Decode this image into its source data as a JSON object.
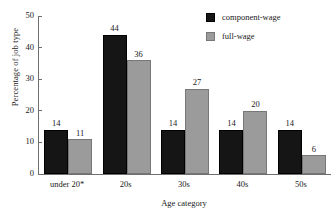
{
  "chart_data": {
    "type": "bar",
    "title": "",
    "xlabel": "Age category",
    "ylabel": "Percentage of job type",
    "categories": [
      "under 20*",
      "20s",
      "30s",
      "40s",
      "50s"
    ],
    "series": [
      {
        "name": "component-wage",
        "color": "#151515",
        "values": [
          14,
          44,
          14,
          14,
          14
        ]
      },
      {
        "name": "full-wage",
        "color": "#9b9b9b",
        "values": [
          11,
          36,
          27,
          20,
          6
        ]
      }
    ],
    "ylim": [
      0,
      50
    ],
    "yticks": [
      0,
      10,
      20,
      30,
      40,
      50
    ],
    "ytick_labels": [
      "0",
      "10",
      "20",
      "30",
      "40",
      "50"
    ],
    "grid": false,
    "legend_position": "top-right",
    "data_labels": true
  },
  "axes": {
    "y_title": "Percentage of job type",
    "x_title": "Age category"
  },
  "legend": {
    "items": [
      {
        "label": "component-wage",
        "swatch": "black"
      },
      {
        "label": "full-wage",
        "swatch": "gray"
      }
    ]
  }
}
